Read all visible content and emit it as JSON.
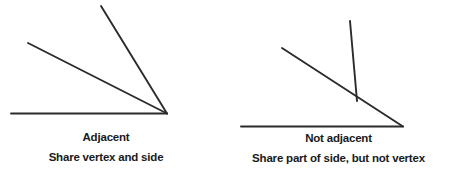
{
  "figure": {
    "background_color": "#ffffff",
    "stroke_color": "#2b2b2b",
    "text_color": "#1a1a1a"
  },
  "panels": [
    {
      "id": "adjacent",
      "title": "Adjacent",
      "subtitle": "Share vertex and side",
      "description": "Two angles sharing a common vertex and a common side",
      "rays": [
        {
          "name": "baseline-ray",
          "x1": 11,
          "y1": 113.5,
          "x2": 167,
          "y2": 113.5
        },
        {
          "name": "middle-ray",
          "x1": 28,
          "y1": 43,
          "x2": 167,
          "y2": 113.5
        },
        {
          "name": "steep-ray",
          "x1": 101,
          "y1": 6,
          "x2": 167,
          "y2": 113.5
        }
      ],
      "vertex": {
        "x": 167,
        "y": 113.5
      }
    },
    {
      "id": "not-adjacent",
      "title": "Not adjacent",
      "subtitle": "Share part of side, but not vertex",
      "description": "Two angles sharing part of a side but having different vertices",
      "rays": [
        {
          "name": "baseline-ray",
          "x1": 241,
          "y1": 126.5,
          "x2": 403,
          "y2": 126.5
        },
        {
          "name": "diagonal-ray",
          "x1": 282,
          "y1": 48,
          "x2": 403,
          "y2": 126.5
        },
        {
          "name": "vertical-ray",
          "x1": 350,
          "y1": 21,
          "x2": 357,
          "y2": 101
        }
      ],
      "vertex": {
        "x": 403,
        "y": 126.5
      },
      "secondary_vertex": {
        "x": 357,
        "y": 101
      }
    }
  ]
}
